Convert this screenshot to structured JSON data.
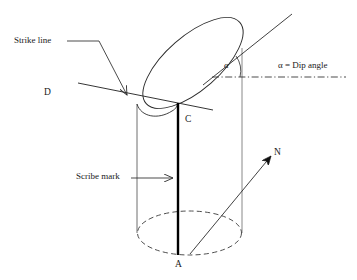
{
  "figure": {
    "labels": {
      "strike_line": "Strike line",
      "point_d": "D",
      "point_c": "C",
      "point_a": "A",
      "north": "N",
      "scribe_mark": "Scribe mark",
      "alpha_symbol": "α",
      "dip_angle_text": "α  = Dip angle"
    },
    "colors": {
      "stroke": "#2b2b2b",
      "background": "#ffffff",
      "scribe": "#000000"
    },
    "geometry": {
      "cylinder_left_x": 137,
      "cylinder_right_x": 242,
      "cylinder_top_y": 103,
      "cylinder_bottom_y": 233,
      "bottom_ellipse_rx": 52,
      "bottom_ellipse_ry": 22,
      "scribe_x": 178,
      "scribe_top_y": 103,
      "scribe_bottom_y": 255,
      "dip_plane_tilt_deg": -40,
      "dash_dot_line_y": 77,
      "dash_dot_line_x1": 213,
      "dash_dot_line_x2": 345
    }
  }
}
